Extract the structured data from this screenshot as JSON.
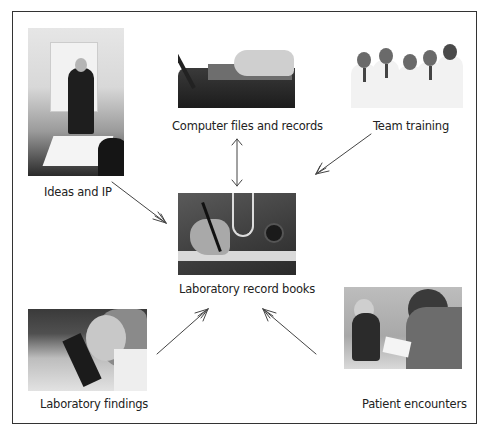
{
  "diagram": {
    "type": "hub-and-spoke flow diagram",
    "center": {
      "id": "books",
      "label": "Laboratory record books",
      "image": "hand writing in notebook with stethoscope"
    },
    "nodes": [
      {
        "id": "ideas",
        "label": "Ideas and IP",
        "image": "presenter at flip chart with seated colleagues"
      },
      {
        "id": "computer",
        "label": "Computer files and records",
        "image": "hands typing on laptop"
      },
      {
        "id": "team",
        "label": "Team training",
        "image": "group of five doctors in white coats"
      },
      {
        "id": "findings",
        "label": "Laboratory findings",
        "image": "scientist looking into microscope"
      },
      {
        "id": "patient",
        "label": "Patient encounters",
        "image": "clinician examining child with stethoscope"
      }
    ],
    "edges": [
      {
        "from": "ideas",
        "to": "books",
        "direction": "one-way"
      },
      {
        "from": "computer",
        "to": "books",
        "direction": "two-way"
      },
      {
        "from": "team",
        "to": "books",
        "direction": "one-way"
      },
      {
        "from": "findings",
        "to": "books",
        "direction": "one-way"
      },
      {
        "from": "patient",
        "to": "books",
        "direction": "one-way"
      }
    ]
  },
  "labels": {
    "ideas": "Ideas and IP",
    "computer": "Computer files and records",
    "team": "Team training",
    "books": "Laboratory record books",
    "findings": "Laboratory findings",
    "patient": "Patient encounters"
  },
  "colors": {
    "border": "#333333",
    "arrow": "#444444",
    "text": "#222222",
    "background": "#ffffff"
  }
}
